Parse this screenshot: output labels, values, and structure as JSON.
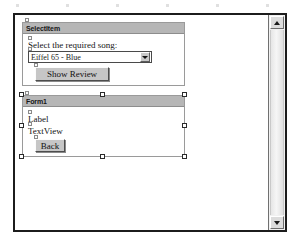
{
  "window": {
    "name": "form-designer-window",
    "scrollbar": {
      "up_arrow": "scroll-up-icon",
      "down_arrow": "scroll-down-icon"
    }
  },
  "forms": [
    {
      "id": "selectitem",
      "title": "SelectItem",
      "selected": false,
      "controls": {
        "prompt_label": "Select the required song:",
        "combobox_value": "Eiffel 65 - Blue",
        "combobox_arrow_icon": "chevron-down-icon",
        "button_label": "Show Review"
      }
    },
    {
      "id": "form1",
      "title": "Form1",
      "selected": true,
      "controls": {
        "label": "Label",
        "textview": "TextView",
        "button_label": "Back"
      }
    }
  ],
  "selection": {
    "handle_count": 8,
    "handle_color": "#ffffff",
    "handle_border_color": "#2a2a2a"
  },
  "colors": {
    "window_border": "#1c1c1c",
    "titlebar": "#b6b6b6",
    "panel_border": "#9a9a9a",
    "button_face": "#c6c6c6",
    "canvas": "#ffffff"
  }
}
